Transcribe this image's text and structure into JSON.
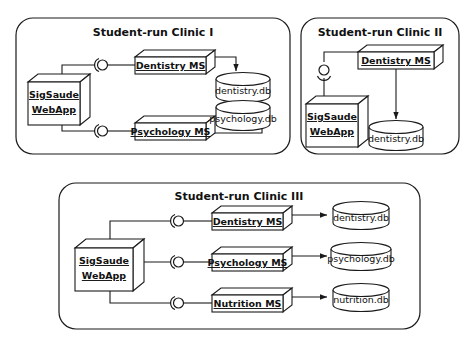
{
  "diagram": {
    "title_visible": false,
    "clinics": [
      {
        "id": "clinic-1",
        "title": "Student-run Clinic I",
        "webapp": {
          "line1": "SigSaude",
          "line2": "WebApp"
        },
        "services": [
          {
            "name": "Dentistry MS",
            "db": "dentistry.db"
          },
          {
            "name": "Psychology MS",
            "db": "psychology.db"
          }
        ]
      },
      {
        "id": "clinic-2",
        "title": "Student-run Clinic II",
        "webapp": {
          "line1": "SigSaude",
          "line2": "WebApp"
        },
        "services": [
          {
            "name": "Dentistry MS",
            "db": "dentistry.db"
          }
        ]
      },
      {
        "id": "clinic-3",
        "title": "Student-run Clinic III",
        "webapp": {
          "line1": "SigSaude",
          "line2": "WebApp"
        },
        "services": [
          {
            "name": "Dentistry MS",
            "db": "dentistry.db"
          },
          {
            "name": "Psychology MS",
            "db": "psychology.db"
          },
          {
            "name": "Nutrition MS",
            "db": "nutrition.db"
          }
        ]
      }
    ],
    "colors": {
      "stroke": "#1a1a1a",
      "fill": "#ffffff",
      "background": "#ffffff"
    },
    "notation": {
      "connector": "ball-and-socket assembly connector",
      "component": "3d-component-box",
      "datastore": "database-cylinder"
    }
  }
}
